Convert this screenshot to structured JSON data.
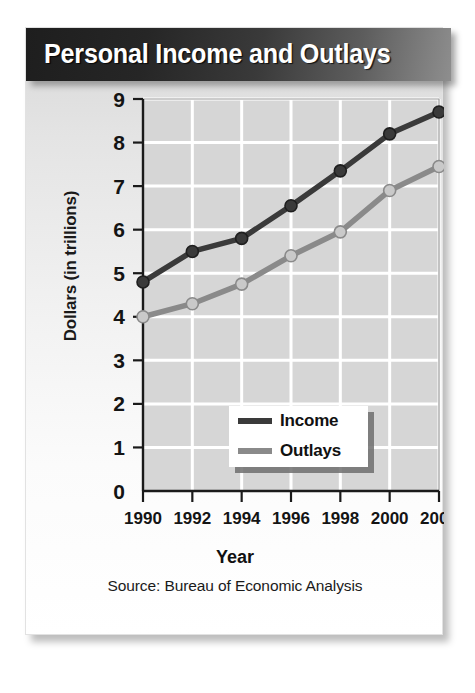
{
  "card": {
    "title": "Personal Income and Outlays",
    "source": "Source: Bureau of Economic Analysis"
  },
  "axes": {
    "x_title": "Year",
    "y_title": "Dollars (in trillions)"
  },
  "legend": {
    "items": [
      {
        "label": "Income",
        "color": "#3a3a3a"
      },
      {
        "label": "Outlays",
        "color": "#8a8a8a"
      }
    ]
  },
  "chart_data": {
    "type": "line",
    "title": "Personal Income and Outlays",
    "xlabel": "Year",
    "ylabel": "Dollars (in trillions)",
    "source": "Source: Bureau of Economic Analysis",
    "categories": [
      1990,
      1992,
      1994,
      1996,
      1998,
      2000,
      2002
    ],
    "x_tick_labels": [
      "1990",
      "1992",
      "1994",
      "1996",
      "1998",
      "2000",
      "2002"
    ],
    "y_tick_labels": [
      "0",
      "1",
      "2",
      "3",
      "4",
      "5",
      "6",
      "7",
      "8",
      "9"
    ],
    "y_ticks": [
      0,
      1,
      2,
      3,
      4,
      5,
      6,
      7,
      8,
      9
    ],
    "ylim": [
      0,
      9
    ],
    "xlim": [
      1990,
      2002
    ],
    "grid": true,
    "legend_position": "inside-bottom-right",
    "series": [
      {
        "name": "Income",
        "color": "#3a3a3a",
        "marker": "circle",
        "values": [
          4.8,
          5.5,
          5.8,
          6.55,
          7.35,
          8.2,
          8.7
        ]
      },
      {
        "name": "Outlays",
        "color": "#8a8a8a",
        "marker": "circle",
        "values": [
          4.0,
          4.3,
          4.75,
          5.4,
          5.95,
          6.9,
          7.45
        ]
      }
    ]
  }
}
